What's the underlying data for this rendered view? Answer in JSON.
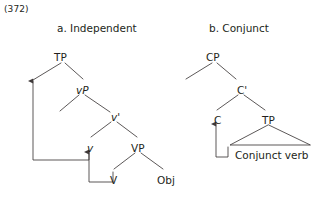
{
  "example": {
    "number": "(372)"
  },
  "panels": [
    {
      "id": "independent",
      "title": "a. Independent",
      "nodes": [
        {
          "name": "node-tp",
          "label": "TP",
          "x": 54,
          "y": 52
        },
        {
          "name": "node-vp-small",
          "label": "vP",
          "x": 76,
          "y": 85
        },
        {
          "name": "node-v-bar",
          "label": "v'",
          "x": 111,
          "y": 112
        },
        {
          "name": "node-v-small",
          "label": "v",
          "x": 87,
          "y": 143
        },
        {
          "name": "node-vp-big",
          "label": "VP",
          "x": 131,
          "y": 143
        },
        {
          "name": "node-v-big",
          "label": "V",
          "x": 110,
          "y": 175
        },
        {
          "name": "node-obj",
          "label": "Obj",
          "x": 157,
          "y": 175
        }
      ]
    },
    {
      "id": "conjunct",
      "title": "b. Conjunct",
      "nodes": [
        {
          "name": "node-cp",
          "label": "CP",
          "x": 206,
          "y": 52
        },
        {
          "name": "node-c-bar",
          "label": "C'",
          "x": 237,
          "y": 85
        },
        {
          "name": "node-c",
          "label": "C",
          "x": 214,
          "y": 115
        },
        {
          "name": "node-tp-right",
          "label": "TP",
          "x": 262,
          "y": 115
        }
      ],
      "leaves": [
        {
          "name": "leaf-conjunct-verb",
          "label": "Conjunct verb",
          "x": 235,
          "y": 150
        }
      ]
    }
  ],
  "style": {
    "line_color": "#3f3a3a",
    "text_color": "#231f20",
    "background": "#ffffff"
  }
}
